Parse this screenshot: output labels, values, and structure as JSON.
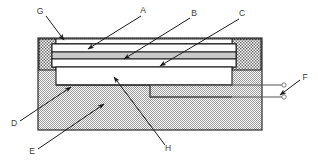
{
  "figure": {
    "type": "cross-section-technical-drawing",
    "background": "#ffffff",
    "line_color": "#1a1a1a",
    "label_color": "#3b3b3b",
    "labels": [
      {
        "key": "G",
        "text": "G",
        "x": 40,
        "y": 12,
        "target_x": 64,
        "target_y": 40
      },
      {
        "key": "A",
        "text": "A",
        "x": 143,
        "y": 11,
        "target_x": 88,
        "target_y": 49
      },
      {
        "key": "B",
        "text": "B",
        "x": 194,
        "y": 14,
        "target_x": 124,
        "target_y": 59
      },
      {
        "key": "C",
        "text": "C",
        "x": 242,
        "y": 14,
        "target_x": 160,
        "target_y": 65
      },
      {
        "key": "F",
        "text": "F",
        "x": 305,
        "y": 78,
        "target_x": 281,
        "target_y": 93
      },
      {
        "key": "D",
        "text": "D",
        "x": 14,
        "y": 124,
        "target_x": 71,
        "target_y": 87
      },
      {
        "key": "E",
        "text": "E",
        "x": 32,
        "y": 152,
        "target_x": 104,
        "target_y": 105
      },
      {
        "key": "H",
        "text": "H",
        "x": 168,
        "y": 149,
        "target_x": 114,
        "target_y": 77
      }
    ],
    "parts": {
      "body": {
        "name": "substrate-base",
        "fill": "dotted-hatch",
        "x": 38,
        "y": 38,
        "width": 224,
        "height": 92
      },
      "left_pillar": {
        "name": "left-pillar",
        "fill": "cross-hatch",
        "x": 38,
        "y": 38,
        "width": 18,
        "height": 32
      },
      "right_pillar": {
        "name": "right-pillar",
        "fill": "cross-hatch",
        "x": 232,
        "y": 38,
        "width": 30,
        "height": 32
      },
      "top_plate": {
        "name": "top-layer",
        "fill": "white",
        "y": 44,
        "height": 8
      },
      "mid_plate": {
        "name": "middle-layer",
        "fill": "#c9c9c9",
        "y": 53,
        "height": 6
      },
      "bottom_plate": {
        "name": "bottom-layer",
        "fill": "white",
        "y": 60,
        "height": 7
      },
      "cavity": {
        "name": "interior-cavity",
        "fill": "white",
        "x": 56,
        "y": 69,
        "width": 176,
        "height": 16
      },
      "notch": {
        "name": "lower-step-notch",
        "x": 150,
        "y": 85,
        "width": 82,
        "height": 12
      }
    },
    "terminals": {
      "name": "electrical-leads",
      "count": 2,
      "lead_top_y": 85,
      "lead_bottom_y": 97,
      "terminal_x": 283,
      "radius": 2.2
    }
  }
}
